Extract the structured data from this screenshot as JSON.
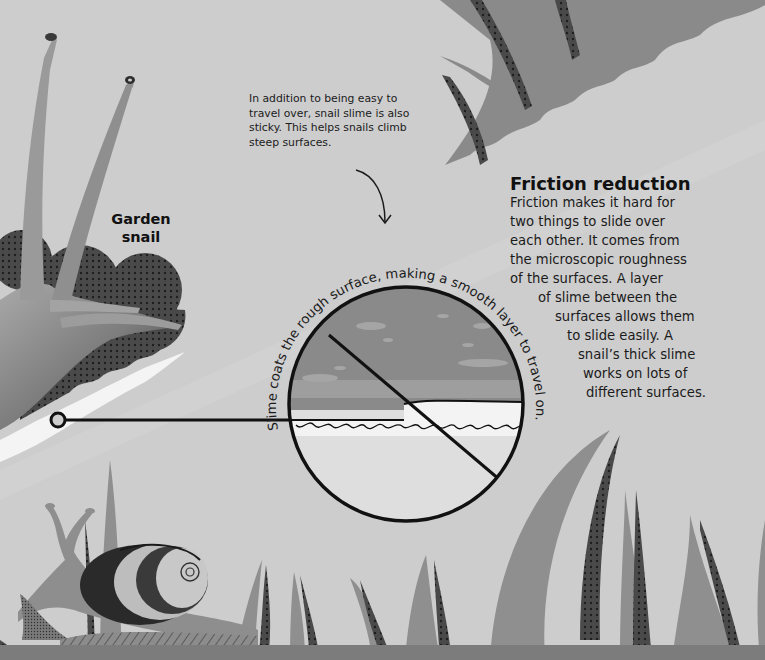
{
  "specimen": {
    "label_line1": "Garden",
    "label_line2": "snail"
  },
  "annotation": {
    "text": "In addition to being easy to travel over, snail slime is also sticky. This helps snails climb steep surfaces."
  },
  "section": {
    "heading": "Friction reduction",
    "body_lines": [
      "Friction makes it hard for",
      "two things to slide over",
      "each other. It comes from",
      "the microscopic roughness",
      "of the surfaces. A layer",
      "of slime between the",
      "surfaces allows them",
      "to slide easily. A",
      "snail’s thick slime",
      "works on lots of",
      "different surfaces."
    ]
  },
  "diagram": {
    "circle_caption": "Slime coats the rough surface, making a smooth layer to travel on."
  },
  "colors": {
    "background": "#cdcdcd",
    "grass_light": "#8f8f8f",
    "grass_dark": "#3c3c3c",
    "slime_upper": "#8a8a8a",
    "slime_band": "#a0a0a0",
    "surface_white": "#f2f2f2",
    "lower_fill": "#dcdcdc",
    "ground": "#7c7c7c",
    "ink": "#111111"
  }
}
